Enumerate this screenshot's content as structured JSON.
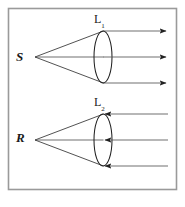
{
  "figure": {
    "background_color": "#ffffff",
    "border_color": "#9a9a9a",
    "ray_color": "#333333",
    "lens_color": "#222222",
    "label_color": "#1a1a1a",
    "frame": {
      "x": 8,
      "y": 8,
      "width": 169,
      "height": 182
    }
  },
  "labels": {
    "source": "S",
    "receiver": "R",
    "lens_top_letter": "L",
    "lens_top_subscript": "1",
    "lens_bottom_letter": "L",
    "lens_bottom_subscript": "2"
  },
  "diagrams": [
    {
      "name": "transmitter",
      "point_label": "S",
      "point": {
        "x": 35,
        "y": 57
      },
      "lens": {
        "cx": 103,
        "cy": 57,
        "rx": 9,
        "ry": 26
      },
      "lens_label": "L1",
      "beam_direction": "outgoing-right",
      "arrow_direction": "right",
      "rays_from_point": [
        {
          "x1": 35,
          "y1": 57,
          "x2": 103,
          "y2": 31
        },
        {
          "x1": 35,
          "y1": 57,
          "x2": 103,
          "y2": 57
        },
        {
          "x1": 35,
          "y1": 57,
          "x2": 103,
          "y2": 83
        }
      ],
      "parallel_rays": [
        {
          "x1": 103,
          "y1": 31,
          "x2": 168,
          "y2": 31
        },
        {
          "x1": 103,
          "y1": 57,
          "x2": 168,
          "y2": 57
        },
        {
          "x1": 103,
          "y1": 83,
          "x2": 168,
          "y2": 83
        }
      ]
    },
    {
      "name": "receiver",
      "point_label": "R",
      "point": {
        "x": 35,
        "y": 140
      },
      "lens": {
        "cx": 103,
        "cy": 140,
        "rx": 9,
        "ry": 26
      },
      "lens_label": "L2",
      "beam_direction": "incoming-left",
      "arrow_direction": "left",
      "rays_from_point": [
        {
          "x1": 35,
          "y1": 140,
          "x2": 103,
          "y2": 114
        },
        {
          "x1": 35,
          "y1": 140,
          "x2": 103,
          "y2": 140
        },
        {
          "x1": 35,
          "y1": 140,
          "x2": 103,
          "y2": 166
        }
      ],
      "parallel_rays": [
        {
          "x1": 168,
          "y1": 114,
          "x2": 103,
          "y2": 114
        },
        {
          "x1": 168,
          "y1": 140,
          "x2": 103,
          "y2": 140
        },
        {
          "x1": 168,
          "y1": 166,
          "x2": 103,
          "y2": 166
        }
      ]
    }
  ]
}
